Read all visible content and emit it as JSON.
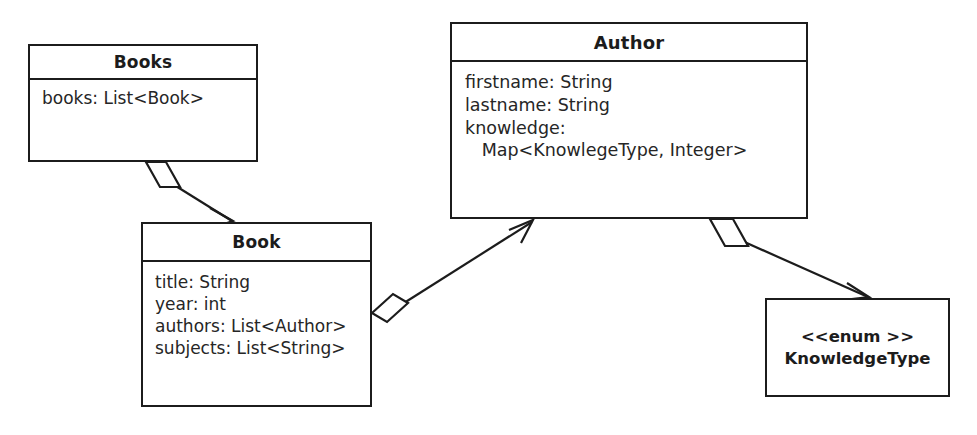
{
  "diagram": {
    "kind": "uml-class-diagram",
    "width": 977,
    "height": 435,
    "background_color": "#ffffff",
    "line_color": "#1c1c1c",
    "text_color": "#262626"
  },
  "classes": {
    "books": {
      "name": "Books",
      "attributes": [
        "books: List<Book>"
      ]
    },
    "author": {
      "name": "Author",
      "attributes": [
        "firstname: String",
        "lastname: String",
        "knowledge:",
        "   Map<KnowlegeType, Integer>"
      ]
    },
    "book": {
      "name": "Book",
      "attributes": [
        "title: String",
        "year: int",
        "authors: List<Author>",
        "subjects: List<String>"
      ]
    },
    "knowledgetype": {
      "stereotype": "<<enum >>",
      "name": "KnowledgeType"
    }
  },
  "relationships": [
    {
      "id": "books-to-book",
      "type": "aggregation",
      "source": "Books",
      "target": "Book",
      "source_end": "hollow-diamond",
      "target_end": "open-arrow"
    },
    {
      "id": "book-to-author",
      "type": "aggregation",
      "source": "Book",
      "target": "Author",
      "source_end": "hollow-diamond",
      "target_end": "open-arrow"
    },
    {
      "id": "author-to-knowledgetype",
      "type": "aggregation",
      "source": "Author",
      "target": "KnowledgeType",
      "source_end": "hollow-diamond",
      "target_end": "open-arrow"
    }
  ]
}
